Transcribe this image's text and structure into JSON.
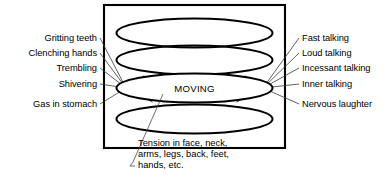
{
  "diagram": {
    "title": "MOVING",
    "core_label": "MOVING",
    "frame": {
      "x": 104,
      "y": 5,
      "width": 181,
      "height": 143
    },
    "colors": {
      "stroke": "#000000",
      "leader": "#3a3a3a",
      "background": "#ffffff"
    },
    "rings": [
      {
        "name": "ring-top",
        "cx": 194.5,
        "cy": 33,
        "rx": 78,
        "ry": 14.5
      },
      {
        "name": "ring-upper-mid",
        "cx": 194.5,
        "cy": 60,
        "rx": 78,
        "ry": 14.5
      },
      {
        "name": "ring-core",
        "cx": 194.5,
        "cy": 88,
        "rx": 78,
        "ry": 14.5
      },
      {
        "name": "ring-bottom",
        "cx": 194.5,
        "cy": 119,
        "rx": 78,
        "ry": 14.5
      }
    ],
    "left_labels": [
      {
        "text": "Gritting teeth",
        "x": 97,
        "y": 41,
        "lx": 100,
        "ly": 38
      },
      {
        "text": "Clenching hands",
        "x": 97,
        "y": 56,
        "lx": 100,
        "ly": 53
      },
      {
        "text": "Trembling",
        "x": 97,
        "y": 71,
        "lx": 100,
        "ly": 68
      },
      {
        "text": "Shivering",
        "x": 97,
        "y": 87,
        "lx": 100,
        "ly": 84
      },
      {
        "text": "Gas in stomach",
        "x": 97,
        "y": 107,
        "lx": 100,
        "ly": 104
      }
    ],
    "right_labels": [
      {
        "text": "Fast talking",
        "x": 302,
        "y": 41,
        "lx": 299,
        "ly": 38
      },
      {
        "text": "Loud talking",
        "x": 302,
        "y": 56,
        "lx": 299,
        "ly": 53
      },
      {
        "text": "Incessant talking",
        "x": 302,
        "y": 71,
        "lx": 299,
        "ly": 68
      },
      {
        "text": "Inner talking",
        "x": 302,
        "y": 87,
        "lx": 299,
        "ly": 84
      },
      {
        "text": "Nervous laughter",
        "x": 302,
        "y": 107,
        "lx": 299,
        "ly": 104
      }
    ],
    "left_hub": {
      "x": 126,
      "y": 88
    },
    "right_hub": {
      "x": 263,
      "y": 88
    },
    "caption": {
      "lines": [
        "Tension in face, neck,",
        "arms, legs, back, feet,",
        "hands, etc."
      ],
      "x": 138,
      "y": 168,
      "line_height": 11,
      "anchor": {
        "x": 163,
        "y": 94
      },
      "elbow": {
        "x": 133,
        "y": 162
      },
      "tick": {
        "x": 130,
        "y": 166
      }
    }
  }
}
